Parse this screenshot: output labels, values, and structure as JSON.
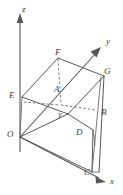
{
  "figure": {
    "background_color": "#ffffff",
    "line_color": "#58585a",
    "label_color": "#3a3a3c"
  },
  "axes": {
    "z": {
      "label": "z",
      "direction": "up"
    },
    "y": {
      "label": "y",
      "direction": "up-right"
    },
    "x": {
      "label": "x",
      "direction": "down-right"
    },
    "origin": {
      "label": "O"
    }
  },
  "vertices": [
    {
      "id": "O",
      "label": "O"
    },
    {
      "id": "E",
      "label": "E"
    },
    {
      "id": "F",
      "label": "F"
    },
    {
      "id": "A",
      "label": "A"
    },
    {
      "id": "G",
      "label": "G"
    },
    {
      "id": "B",
      "label": "B"
    },
    {
      "id": "D",
      "label": "D"
    },
    {
      "id": "C",
      "label": "C"
    }
  ],
  "annotations": [
    {
      "id": "segment-y",
      "label": "y"
    }
  ]
}
